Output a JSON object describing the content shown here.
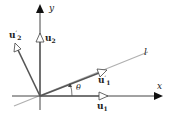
{
  "diagram": {
    "type": "vector rotation diagram",
    "axes": {
      "x_label": "x",
      "y_label": "y"
    },
    "line_label": "l",
    "angle_label": "θ",
    "vectors": [
      {
        "name": "u",
        "sub": "1",
        "prime": ""
      },
      {
        "name": "u",
        "sub": "2",
        "prime": ""
      },
      {
        "name": "u",
        "sub": "1",
        "prime": "′"
      },
      {
        "name": "u",
        "sub": "2",
        "prime": "′"
      }
    ],
    "colors": {
      "axis": "#111111",
      "line": "#aaaaaa",
      "vector": "#555555"
    }
  }
}
